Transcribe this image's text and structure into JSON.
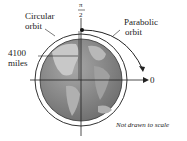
{
  "labels": {
    "circular_orbit_1": "Circular",
    "circular_orbit_2": "orbit",
    "parabolic_orbit_1": "Parabolic",
    "parabolic_orbit_2": "orbit",
    "distance_1": "4100",
    "distance_2": "miles",
    "pi": "π",
    "two": "2",
    "zero": "0",
    "note": "Not drawn to scale"
  },
  "colors": {
    "earth": "#8a8a8a",
    "land": "#b8b8b8",
    "line": "#222222"
  }
}
